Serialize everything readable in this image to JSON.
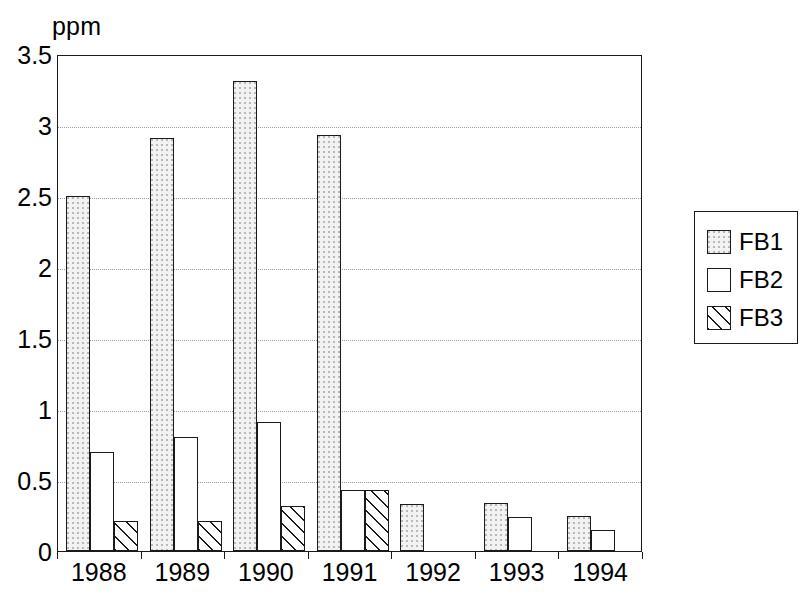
{
  "chart_data": {
    "type": "bar",
    "title": "",
    "subtitle": "",
    "xlabel": "",
    "ylabel": "ppm",
    "ylim": [
      0,
      3.5
    ],
    "ytick_labels": [
      "0",
      "0.5",
      "1",
      "1.5",
      "2",
      "2.5",
      "3",
      "3.5"
    ],
    "ytick_values": [
      0,
      0.5,
      1,
      1.5,
      2,
      2.5,
      3,
      3.5
    ],
    "grid": true,
    "grid_style": "dotted-horizontal",
    "legend_position": "right",
    "categories": [
      "1988",
      "1989",
      "1990",
      "1991",
      "1992",
      "1993",
      "1994"
    ],
    "series": [
      {
        "name": "FB1",
        "fill": "light-dotted",
        "values": [
          2.5,
          2.91,
          3.31,
          2.93,
          0.33,
          0.34,
          0.25
        ]
      },
      {
        "name": "FB2",
        "fill": "white",
        "values": [
          0.7,
          0.8,
          0.91,
          0.43,
          0,
          0.24,
          0.15
        ]
      },
      {
        "name": "FB3",
        "fill": "diagonal-hatch",
        "values": [
          0.21,
          0.21,
          0.32,
          0.43,
          0,
          0,
          0
        ]
      }
    ]
  },
  "axis": {
    "unit_label": "ppm"
  },
  "legend": {
    "entries": [
      {
        "label": "FB1",
        "fill": "light-dotted"
      },
      {
        "label": "FB2",
        "fill": "white"
      },
      {
        "label": "FB3",
        "fill": "diagonal-hatch"
      }
    ]
  },
  "colors": {
    "ink": "#1a1a1a",
    "grid": "#9a9a9a",
    "fb1_fill": "#f2f2f2",
    "fb2_fill": "#ffffff",
    "fb3_fill": "#ffffff",
    "background": "#ffffff"
  }
}
